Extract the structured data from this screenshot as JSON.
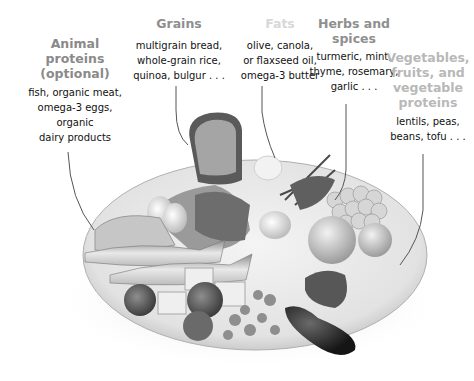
{
  "diagram": {
    "categories": [
      {
        "key": "animal",
        "heading": [
          "Animal",
          "proteins",
          "(optional)"
        ],
        "description": [
          "fish, organic meat,",
          "omega-3 eggs,",
          "organic",
          "dairy products"
        ]
      },
      {
        "key": "grains",
        "heading": [
          "Grains"
        ],
        "description": [
          "multigrain bread,",
          "whole-grain rice,",
          "quinoa, bulgur . . ."
        ]
      },
      {
        "key": "fats",
        "heading": [
          "Fats"
        ],
        "description": [
          "olive, canola,",
          "or flaxseed oil,",
          "omega-3 butter"
        ]
      },
      {
        "key": "herbs",
        "heading": [
          "Herbs and",
          "spices"
        ],
        "description": [
          "turmeric, mint,",
          "thyme, rosemary,",
          "garlic . . ."
        ]
      },
      {
        "key": "veg",
        "heading": [
          "Vegetables,",
          "fruits, and",
          "vegetable",
          "proteins"
        ],
        "description": [
          "lentils, peas,",
          "beans, tofu . . ."
        ]
      }
    ],
    "image": {
      "description": "grayscale illustration of a plate with fish, eggs, bread, grains, garlic, herbs, grapes, fruit, tofu, broccoli, tomato, beans, eggplant, pepper"
    }
  }
}
